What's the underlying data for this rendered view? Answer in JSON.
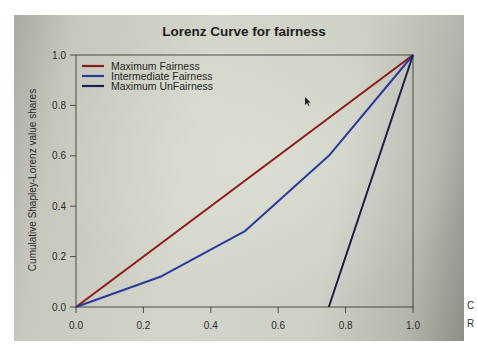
{
  "chart_data": {
    "type": "line",
    "title": "Lorenz Curve for fairness",
    "xlabel": "",
    "ylabel": "Cumulative Shapley-Lorenz value shares",
    "xlim": [
      0.0,
      1.0
    ],
    "ylim": [
      0.0,
      1.0
    ],
    "x_ticks": [
      "0.0",
      "0.2",
      "0.4",
      "0.6",
      "0.8",
      "1.0"
    ],
    "y_ticks": [
      "0.0",
      "0.2",
      "0.4",
      "0.6",
      "0.8",
      "1.0"
    ],
    "grid": false,
    "legend_position": "top-left",
    "series": [
      {
        "name": "Maximum Fairness",
        "color": "#8b1a1a",
        "points": [
          [
            0.0,
            0.0
          ],
          [
            1.0,
            1.0
          ]
        ]
      },
      {
        "name": "Intermediate Fairness",
        "color": "#2b3a9a",
        "points": [
          [
            0.0,
            0.0
          ],
          [
            0.25,
            0.12
          ],
          [
            0.5,
            0.3
          ],
          [
            0.75,
            0.6
          ],
          [
            1.0,
            1.0
          ]
        ]
      },
      {
        "name": "Maximum UnFairness",
        "color": "#1c1f4a",
        "points": [
          [
            0.75,
            0.0
          ],
          [
            1.0,
            1.0
          ]
        ]
      }
    ]
  },
  "legend": {
    "items": [
      {
        "label": "Maximum Fairness",
        "color": "#8b1a1a"
      },
      {
        "label": "Intermediate Fairness",
        "color": "#2b3a9a"
      },
      {
        "label": "Maximum UnFairness",
        "color": "#1c1f4a"
      }
    ]
  },
  "side_glyphs": [
    "C",
    "R"
  ]
}
